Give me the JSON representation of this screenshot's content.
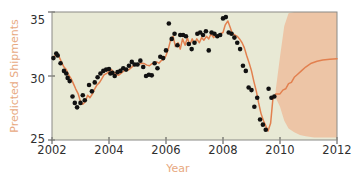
{
  "chart_data": {
    "type": "line",
    "title": "",
    "subtitle": "",
    "xlabel": "Year",
    "ylabel": "Predicted Shipments",
    "xlim": [
      2002,
      2012
    ],
    "ylim": [
      25,
      35
    ],
    "xticks": [
      2002,
      2004,
      2006,
      2008,
      2010,
      2012
    ],
    "xticklabels": [
      "2002",
      "2004",
      "2006",
      "2008",
      "2010",
      "2012"
    ],
    "yticks": [
      25,
      30,
      35
    ],
    "yticklabels": [
      "25",
      "30",
      "35"
    ],
    "grid": false,
    "legend": null,
    "plot_bgcolor": "#e8e9d5",
    "line_color": "#e2804f",
    "band_color": "#edc5a6",
    "marker_color": "#111111",
    "label_color": "#e8a97f",
    "tick_color": "#2e2e2e",
    "forecast_start": 2009.85,
    "series": [
      {
        "name": "Fitted / forecast line",
        "kind": "line",
        "x": [
          2002.05,
          2002.15,
          2002.25,
          2002.33,
          2002.42,
          2002.5,
          2002.58,
          2002.67,
          2002.75,
          2002.83,
          2002.92,
          2003.0,
          2003.08,
          2003.17,
          2003.25,
          2003.33,
          2003.42,
          2003.5,
          2003.58,
          2003.67,
          2003.75,
          2003.83,
          2003.92,
          2004.0,
          2004.08,
          2004.17,
          2004.25,
          2004.33,
          2004.42,
          2004.5,
          2004.58,
          2004.67,
          2004.75,
          2004.83,
          2004.92,
          2005.0,
          2005.08,
          2005.17,
          2005.25,
          2005.33,
          2005.42,
          2005.5,
          2005.58,
          2005.67,
          2005.75,
          2005.83,
          2005.92,
          2006.0,
          2006.08,
          2006.17,
          2006.25,
          2006.33,
          2006.42,
          2006.5,
          2006.58,
          2006.67,
          2006.75,
          2006.83,
          2006.92,
          2007.0,
          2007.08,
          2007.17,
          2007.25,
          2007.33,
          2007.42,
          2007.5,
          2007.58,
          2007.67,
          2007.75,
          2007.83,
          2007.92,
          2008.0,
          2008.08,
          2008.17,
          2008.25,
          2008.33,
          2008.42,
          2008.5,
          2008.58,
          2008.67,
          2008.75,
          2008.83,
          2008.92,
          2009.0,
          2009.08,
          2009.17,
          2009.25,
          2009.33,
          2009.42,
          2009.5,
          2009.58,
          2009.67,
          2009.75,
          2009.85,
          2010.0,
          2010.1,
          2010.2,
          2010.3,
          2010.4,
          2010.5,
          2010.6,
          2010.75,
          2010.9,
          2011.1,
          2011.3,
          2011.5,
          2011.75,
          2012.0
        ],
        "y": [
          31.45,
          31.7,
          31.5,
          31.1,
          30.7,
          30.5,
          30.1,
          29.8,
          29.4,
          29.0,
          28.6,
          28.0,
          27.8,
          28.0,
          28.5,
          28.3,
          28.6,
          29.0,
          29.3,
          29.5,
          29.8,
          30.1,
          30.2,
          30.35,
          30.5,
          30.3,
          30.15,
          30.05,
          30.2,
          30.35,
          30.5,
          30.45,
          30.6,
          30.75,
          30.9,
          30.85,
          30.95,
          31.0,
          30.95,
          30.85,
          30.8,
          30.95,
          31.0,
          31.1,
          31.0,
          31.2,
          31.3,
          31.6,
          32.1,
          32.9,
          33.1,
          32.3,
          32.6,
          32.1,
          32.9,
          32.4,
          33.0,
          32.4,
          32.9,
          32.5,
          32.9,
          32.6,
          33.0,
          32.8,
          33.1,
          32.9,
          33.3,
          33.0,
          33.2,
          33.1,
          33.3,
          33.4,
          34.0,
          34.3,
          33.8,
          33.3,
          33.2,
          33.1,
          32.9,
          32.6,
          32.2,
          31.6,
          31.0,
          30.4,
          29.6,
          28.8,
          27.9,
          27.1,
          26.5,
          26.1,
          25.7,
          26.3,
          28.2,
          28.6,
          28.6,
          28.9,
          29.0,
          29.4,
          29.5,
          29.9,
          30.1,
          30.4,
          30.7,
          31.0,
          31.15,
          31.25,
          31.3,
          31.35
        ]
      },
      {
        "name": "Observed shipments",
        "kind": "scatter",
        "x": [
          2002.05,
          2002.15,
          2002.2,
          2002.3,
          2002.42,
          2002.5,
          2002.55,
          2002.62,
          2002.72,
          2002.8,
          2002.88,
          2003.0,
          2003.08,
          2003.15,
          2003.3,
          2003.4,
          2003.5,
          2003.6,
          2003.7,
          2003.8,
          2003.9,
          2004.0,
          2004.05,
          2004.12,
          2004.2,
          2004.3,
          2004.4,
          2004.5,
          2004.6,
          2004.7,
          2004.8,
          2004.9,
          2005.0,
          2005.1,
          2005.2,
          2005.3,
          2005.4,
          2005.5,
          2005.6,
          2005.7,
          2005.8,
          2005.9,
          2006.0,
          2006.1,
          2006.2,
          2006.3,
          2006.4,
          2006.5,
          2006.6,
          2006.7,
          2006.8,
          2006.9,
          2007.0,
          2007.1,
          2007.2,
          2007.3,
          2007.4,
          2007.5,
          2007.6,
          2007.7,
          2007.8,
          2007.9,
          2008.0,
          2008.1,
          2008.2,
          2008.3,
          2008.4,
          2008.5,
          2008.6,
          2008.7,
          2008.8,
          2008.9,
          2009.0,
          2009.1,
          2009.2,
          2009.3,
          2009.4,
          2009.5,
          2009.6,
          2009.7,
          2009.8
        ],
        "y": [
          31.4,
          31.75,
          31.6,
          31.0,
          30.4,
          30.2,
          29.85,
          29.6,
          28.4,
          27.9,
          27.55,
          27.9,
          28.5,
          28.1,
          29.3,
          28.8,
          29.5,
          29.9,
          30.2,
          30.4,
          30.5,
          30.55,
          30.2,
          30.25,
          30.0,
          30.3,
          30.4,
          30.6,
          30.5,
          30.8,
          31.1,
          30.9,
          30.9,
          31.2,
          30.7,
          30.0,
          30.1,
          30.05,
          31.0,
          30.6,
          31.5,
          31.4,
          32.0,
          34.1,
          32.9,
          33.3,
          32.4,
          33.2,
          33.2,
          33.1,
          32.5,
          32.1,
          32.6,
          33.3,
          33.4,
          33.2,
          33.5,
          32.0,
          33.4,
          33.3,
          33.1,
          33.2,
          34.5,
          34.6,
          33.4,
          33.3,
          33.0,
          32.6,
          32.1,
          30.8,
          30.4,
          29.1,
          28.9,
          27.6,
          28.3,
          26.6,
          26.2,
          25.8,
          29.0,
          28.3,
          28.4
        ]
      }
    ],
    "forecast_band": {
      "name": "Prediction interval",
      "x": [
        2009.85,
        2010.0,
        2010.15,
        2010.3,
        2010.5,
        2010.7,
        2010.9,
        2011.2,
        2011.5,
        2011.8,
        2012.0
      ],
      "upper": [
        28.9,
        31.5,
        33.9,
        34.9,
        35.0,
        35.0,
        35.0,
        35.0,
        35.0,
        35.0,
        35.0
      ],
      "lower": [
        28.3,
        27.6,
        26.5,
        25.9,
        25.6,
        25.4,
        25.3,
        25.2,
        25.2,
        25.2,
        25.2
      ]
    }
  },
  "axes": {
    "y_label": "Predicted Shipments",
    "x_label": "Year",
    "y_tick_25": "25",
    "y_tick_30": "30",
    "y_tick_35": "35",
    "x_tick_2002": "2002",
    "x_tick_2004": "2004",
    "x_tick_2006": "2006",
    "x_tick_2008": "2008",
    "x_tick_2010": "2010",
    "x_tick_2012": "2012"
  }
}
